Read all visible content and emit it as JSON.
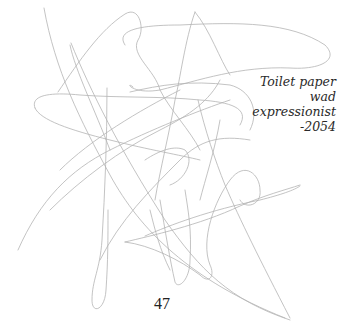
{
  "artwork": {
    "title_lines": [
      "Toilet paper",
      "wad",
      "expressionist",
      "-2054"
    ],
    "stroke_color": "#b4b4b4",
    "text_color": "#2a2a2a"
  },
  "page": {
    "number": "47"
  }
}
